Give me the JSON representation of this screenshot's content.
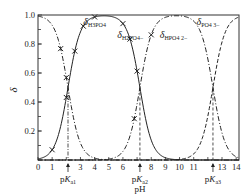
{
  "chart_data": {
    "type": "line",
    "title": "",
    "xlabel": "pH",
    "ylabel": "δ",
    "xlim": [
      0,
      14.2
    ],
    "ylim": [
      0,
      1.0
    ],
    "x_ticks": [
      "0",
      "1",
      "3",
      "4",
      "5",
      "6",
      "8",
      "9",
      "10",
      "11",
      "13",
      "14"
    ],
    "x_tick_values": [
      0,
      1,
      3,
      4,
      5,
      6,
      8,
      9,
      10,
      11,
      13,
      14
    ],
    "y_ticks": [
      "0.2",
      "0.4",
      "0.6",
      "0.8",
      "1.0"
    ],
    "y_tick_values": [
      0.2,
      0.4,
      0.6,
      0.8,
      1.0
    ],
    "pKa": [
      {
        "label_main": "pK",
        "label_sub": "a",
        "label_idx": "1",
        "value": 2.12
      },
      {
        "label_main": "pK",
        "label_sub": "a",
        "label_idx": "2",
        "value": 7.2
      },
      {
        "label_main": "pK",
        "label_sub": "a",
        "label_idx": "3",
        "value": 12.36
      }
    ],
    "series": [
      {
        "name": "δ H3PO4",
        "label_main": "δ",
        "label_sub": "H3PO4",
        "species_index": 0,
        "style": "dash-dot",
        "label_at": [
          3.2,
          0.93
        ]
      },
      {
        "name": "δ H2PO4-",
        "label_main": "δ",
        "label_sub": "H2PO4−",
        "species_index": 1,
        "style": "solid",
        "label_at": [
          5.6,
          0.84
        ]
      },
      {
        "name": "δ HPO4 2-",
        "label_main": "δ",
        "label_sub": "HPO4 2−",
        "species_index": 2,
        "style": "dash-dot",
        "label_at": [
          8.6,
          0.84
        ]
      },
      {
        "name": "δ PO4 3-",
        "label_main": "δ",
        "label_sub": "PO4 3−",
        "species_index": 3,
        "style": "dashed",
        "label_at": [
          11.2,
          0.93
        ]
      }
    ],
    "markers": [
      {
        "series": "δ H3PO4",
        "x": [
          1.6,
          2.0
        ]
      },
      {
        "series": "δ H2PO4-",
        "x": [
          1.0,
          2.0,
          2.6,
          3.2,
          4.0,
          6.5
        ]
      },
      {
        "series": "δ HPO4 2-",
        "x": [
          6.8,
          8.0
        ]
      },
      {
        "series": "δ H2PO4-",
        "x": [
          6.0,
          7.0
        ]
      }
    ],
    "grid": false,
    "legend": "inline labels"
  }
}
